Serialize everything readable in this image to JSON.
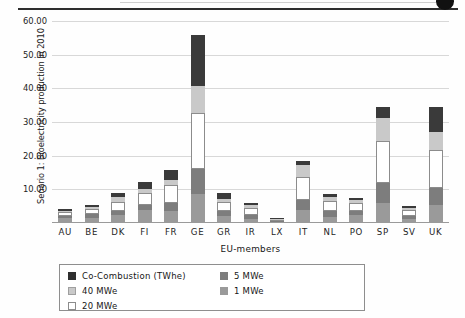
{
  "chart_data": {
    "type": "bar",
    "subtype": "stacked-bar",
    "title": "",
    "xlabel": "EU-members",
    "ylabel": "Senario 1: Bioelectricity production in 2010",
    "ylim": [
      0,
      60
    ],
    "ytick_values": [
      0,
      10,
      20,
      30,
      40,
      50,
      60
    ],
    "ytick_labels": [
      "0.00",
      "10.00",
      "20.00",
      "30.00",
      "40.00",
      "50.00",
      "60.00"
    ],
    "ytick_labels_shown": [
      "10.00",
      "20.00",
      "30.00",
      "40.00",
      "50.00",
      "60.00"
    ],
    "grid": true,
    "grid_axis": "y",
    "legend_position": "below-axes",
    "categories": [
      "AU",
      "BE",
      "DK",
      "FI",
      "FR",
      "GE",
      "GR",
      "IR",
      "LX",
      "IT",
      "NL",
      "PO",
      "SP",
      "SV",
      "UK"
    ],
    "series": [
      {
        "name": "1 MWe",
        "color": "#9a9a9a",
        "values": [
          1.5,
          1.6,
          2.3,
          4.0,
          3.5,
          8.7,
          2.2,
          1.3,
          0.15,
          4.0,
          1.8,
          2.4,
          6.0,
          1.3,
          5.3
        ]
      },
      {
        "name": "5 MWe",
        "color": "#7d7d7d",
        "values": [
          0.6,
          1.1,
          1.3,
          1.3,
          2.4,
          7.3,
          1.3,
          1.0,
          0.1,
          2.9,
          1.9,
          1.2,
          5.9,
          0.8,
          5.2
        ]
      },
      {
        "name": "20 MWe",
        "color": "#ffffff",
        "values": [
          1.1,
          1.5,
          2.6,
          3.6,
          5.5,
          16.8,
          2.6,
          2.3,
          0.12,
          6.9,
          2.9,
          2.4,
          12.6,
          1.7,
          11.1
        ]
      },
      {
        "name": "40 MWe",
        "color": "#c9c9c9",
        "values": [
          0.5,
          0.6,
          1.6,
          1.1,
          1.5,
          7.9,
          1.1,
          0.9,
          0.05,
          3.3,
          1.1,
          0.8,
          6.6,
          0.8,
          5.4
        ]
      },
      {
        "name": "Co-Combustion (TWhe)",
        "color": "#3a3a3a",
        "values": [
          0.5,
          0.7,
          1.0,
          2.1,
          2.9,
          15.2,
          1.8,
          0.6,
          0.03,
          1.4,
          0.8,
          0.5,
          3.3,
          0.5,
          7.5
        ]
      }
    ],
    "totals": [
      4.2,
      5.5,
      8.8,
      12.1,
      15.8,
      55.9,
      9.0,
      6.1,
      0.45,
      18.5,
      8.5,
      7.3,
      34.4,
      5.1,
      34.5
    ]
  },
  "legend": {
    "items": [
      {
        "label": "Co-Combustion (TWhe)",
        "swatch": "sw-co",
        "column": "left"
      },
      {
        "label": "40 MWe",
        "swatch": "sw-40",
        "column": "left"
      },
      {
        "label": "20 MWe",
        "swatch": "sw-20",
        "column": "left"
      },
      {
        "label": "5 MWe",
        "swatch": "sw-5",
        "column": "right"
      },
      {
        "label": "1 MWe",
        "swatch": "sw-1",
        "column": "right"
      }
    ]
  },
  "colors": {
    "co_combustion": "#3a3a3a",
    "mwe_40": "#c9c9c9",
    "mwe_20": "#ffffff",
    "mwe_5": "#7d7d7d",
    "mwe_1": "#9a9a9a",
    "grid": "#d8d8d8",
    "axis": "#9a9a9a"
  }
}
